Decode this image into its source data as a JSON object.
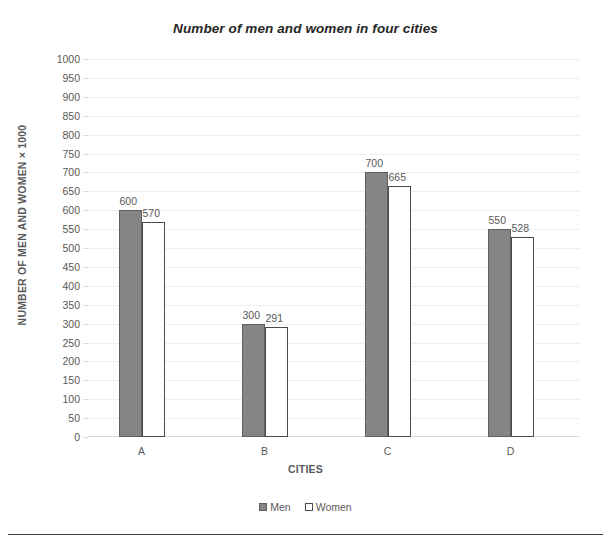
{
  "chart_data": {
    "type": "bar",
    "title": "Number of men and women in four cities",
    "xlabel": "CITIES",
    "ylabel": "NUMBER OF MEN AND WOMEN × 1000",
    "categories": [
      "A",
      "B",
      "C",
      "D"
    ],
    "series": [
      {
        "name": "Men",
        "values": [
          600,
          300,
          700,
          550
        ],
        "color": "#858585"
      },
      {
        "name": "Women",
        "values": [
          570,
          291,
          665,
          528
        ],
        "color": "#ffffff"
      }
    ],
    "ylim": [
      0,
      1000
    ],
    "ytick_step": 50,
    "yticks": [
      1000,
      950,
      900,
      850,
      800,
      750,
      700,
      650,
      600,
      550,
      500,
      450,
      400,
      350,
      300,
      250,
      200,
      150,
      100,
      50,
      0
    ],
    "ytick_labels": [
      "1000",
      "950",
      "900",
      "850",
      "800",
      "750",
      "700",
      "650",
      "600",
      "550",
      "500",
      "450",
      "400",
      "350",
      "300",
      "250",
      "200",
      "150",
      "100",
      "50",
      "0"
    ],
    "grid": true,
    "grid_axis": "y",
    "legend_position": "bottom",
    "data_labels": true,
    "data_label_values": {
      "men": [
        "600",
        "300",
        "700",
        "550"
      ],
      "women": [
        "570",
        "291",
        "665",
        "528"
      ]
    }
  },
  "legend": {
    "entries": [
      {
        "label": "Men"
      },
      {
        "label": "Women"
      }
    ]
  }
}
